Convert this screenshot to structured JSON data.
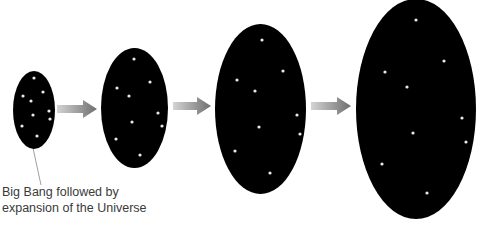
{
  "diagram": {
    "title": "Expansion of the Universe",
    "caption": {
      "line1": "Big Bang followed by",
      "line2": "expansion of the Universe"
    },
    "colors": {
      "background": "#ffffff",
      "universe_fill": "#000000",
      "star": "#e8e8e8",
      "arrow_start": "#d4d4d4",
      "arrow_end": "#6e6e6e",
      "leader_line": "#888888",
      "caption_text": "#3a3a3a"
    },
    "stages": [
      {
        "id": "stage-1",
        "cx": 34,
        "cy": 110,
        "rx": 21,
        "ry": 39,
        "stars": [
          [
            34,
            78
          ],
          [
            23,
            96
          ],
          [
            43,
            92
          ],
          [
            31,
            101
          ],
          [
            49,
            111
          ],
          [
            33,
            115
          ],
          [
            50,
            119
          ],
          [
            22,
            126
          ],
          [
            37,
            136
          ]
        ]
      },
      {
        "id": "stage-2",
        "cx": 134.5,
        "cy": 108,
        "rx": 33.5,
        "ry": 60,
        "stars": [
          [
            134,
            59
          ],
          [
            117,
            88
          ],
          [
            150,
            82
          ],
          [
            129,
            96
          ],
          [
            158,
            113
          ],
          [
            132,
            122
          ],
          [
            162,
            126
          ],
          [
            116,
            139
          ],
          [
            140,
            155
          ]
        ]
      },
      {
        "id": "stage-3",
        "cx": 260.5,
        "cy": 109,
        "rx": 45.5,
        "ry": 85,
        "stars": [
          [
            262,
            40
          ],
          [
            283,
            71
          ],
          [
            237,
            80
          ],
          [
            255,
            91
          ],
          [
            297,
            115
          ],
          [
            259,
            127
          ],
          [
            300,
            134
          ],
          [
            235,
            151
          ],
          [
            270,
            173
          ]
        ]
      },
      {
        "id": "stage-4",
        "cx": 416,
        "cy": 109,
        "rx": 60,
        "ry": 110,
        "stars": [
          [
            416,
            20
          ],
          [
            444,
            61
          ],
          [
            385,
            72
          ],
          [
            407,
            87
          ],
          [
            462,
            118
          ],
          [
            413,
            133
          ],
          [
            466,
            142
          ],
          [
            382,
            164
          ],
          [
            427,
            193
          ]
        ]
      }
    ],
    "arrows": [
      {
        "from": "stage-1",
        "to": "stage-2",
        "x1": 57,
        "x2": 97,
        "y": 109
      },
      {
        "from": "stage-2",
        "to": "stage-3",
        "x1": 173,
        "x2": 211,
        "y": 106
      },
      {
        "from": "stage-3",
        "to": "stage-4",
        "x1": 311,
        "x2": 351,
        "y": 106
      }
    ],
    "leader_line": {
      "x1": 33,
      "y1": 148,
      "x2": 41,
      "y2": 185
    }
  }
}
